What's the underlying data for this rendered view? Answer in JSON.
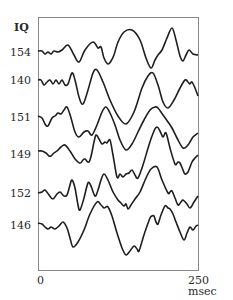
{
  "chart_data": {
    "type": "line",
    "title": "",
    "ylabel": "IQ",
    "xlabel": "",
    "x_tick_labels": [
      "0",
      "250 msec"
    ],
    "x_range_msec": [
      0,
      250
    ],
    "grid": false,
    "legend": null,
    "series": [
      {
        "name": "154",
        "points": [
          [
            38,
            51
          ],
          [
            42,
            51
          ],
          [
            45,
            54
          ],
          [
            48,
            52
          ],
          [
            51,
            54
          ],
          [
            54,
            51
          ],
          [
            58,
            52
          ],
          [
            62,
            50
          ],
          [
            68,
            45
          ],
          [
            74,
            55
          ],
          [
            79,
            62
          ],
          [
            85,
            50
          ],
          [
            93,
            42
          ],
          [
            98,
            48
          ],
          [
            101,
            47
          ],
          [
            104,
            58
          ],
          [
            108,
            64
          ],
          [
            111,
            61
          ],
          [
            114,
            55
          ],
          [
            118,
            42
          ],
          [
            124,
            32
          ],
          [
            132,
            30
          ],
          [
            140,
            40
          ],
          [
            146,
            58
          ],
          [
            151,
            68
          ],
          [
            155,
            60
          ],
          [
            158,
            55
          ],
          [
            162,
            50
          ],
          [
            167,
            38
          ],
          [
            172,
            28
          ],
          [
            176,
            40
          ],
          [
            180,
            56
          ],
          [
            183,
            61
          ],
          [
            186,
            55
          ],
          [
            189,
            50
          ],
          [
            193,
            54
          ],
          [
            198,
            55
          ]
        ]
      },
      {
        "name": "140",
        "points": [
          [
            38,
            80
          ],
          [
            41,
            80
          ],
          [
            44,
            85
          ],
          [
            47,
            82
          ],
          [
            50,
            80
          ],
          [
            53,
            84
          ],
          [
            56,
            80
          ],
          [
            59,
            84
          ],
          [
            62,
            80
          ],
          [
            65,
            85
          ],
          [
            68,
            84
          ],
          [
            72,
            73
          ],
          [
            75,
            80
          ],
          [
            79,
            97
          ],
          [
            83,
            104
          ],
          [
            88,
            90
          ],
          [
            93,
            73
          ],
          [
            97,
            70
          ],
          [
            103,
            82
          ],
          [
            110,
            100
          ],
          [
            118,
            116
          ],
          [
            126,
            124
          ],
          [
            134,
            112
          ],
          [
            142,
            88
          ],
          [
            148,
            76
          ],
          [
            153,
            73
          ],
          [
            158,
            85
          ],
          [
            163,
            102
          ],
          [
            168,
            108
          ],
          [
            174,
            100
          ],
          [
            180,
            88
          ],
          [
            185,
            80
          ],
          [
            188,
            82
          ],
          [
            190,
            84
          ],
          [
            192,
            82
          ],
          [
            195,
            88
          ],
          [
            198,
            96
          ]
        ]
      },
      {
        "name": "151",
        "points": [
          [
            38,
            116
          ],
          [
            42,
            118
          ],
          [
            45,
            124
          ],
          [
            48,
            126
          ],
          [
            52,
            118
          ],
          [
            55,
            116
          ],
          [
            58,
            113
          ],
          [
            61,
            114
          ],
          [
            64,
            110
          ],
          [
            67,
            107
          ],
          [
            71,
            118
          ],
          [
            75,
            132
          ],
          [
            79,
            137
          ],
          [
            84,
            132
          ],
          [
            88,
            131
          ],
          [
            92,
            135
          ],
          [
            97,
            125
          ],
          [
            102,
            112
          ],
          [
            106,
            107
          ],
          [
            110,
            113
          ],
          [
            115,
            125
          ],
          [
            120,
            140
          ],
          [
            126,
            150
          ],
          [
            132,
            144
          ],
          [
            138,
            132
          ],
          [
            144,
            120
          ],
          [
            150,
            110
          ],
          [
            155,
            107
          ],
          [
            158,
            108
          ],
          [
            163,
            115
          ],
          [
            168,
            122
          ],
          [
            172,
            128
          ],
          [
            177,
            138
          ],
          [
            183,
            148
          ],
          [
            188,
            145
          ],
          [
            193,
            137
          ],
          [
            198,
            133
          ]
        ]
      },
      {
        "name": "149",
        "points": [
          [
            38,
            151
          ],
          [
            42,
            151
          ],
          [
            46,
            153
          ],
          [
            49,
            156
          ],
          [
            51,
            156
          ],
          [
            54,
            153
          ],
          [
            57,
            151
          ],
          [
            61,
            147
          ],
          [
            65,
            145
          ],
          [
            70,
            151
          ],
          [
            75,
            159
          ],
          [
            80,
            163
          ],
          [
            83,
            160
          ],
          [
            85,
            159
          ],
          [
            89,
            162
          ],
          [
            92,
            152
          ],
          [
            94,
            142
          ],
          [
            96,
            135
          ],
          [
            99,
            139
          ],
          [
            102,
            144
          ],
          [
            105,
            142
          ],
          [
            107,
            143
          ],
          [
            110,
            140
          ],
          [
            113,
            155
          ],
          [
            117,
            177
          ],
          [
            120,
            174
          ],
          [
            123,
            177
          ],
          [
            126,
            174
          ],
          [
            129,
            173
          ],
          [
            132,
            170
          ],
          [
            135,
            175
          ],
          [
            138,
            178
          ],
          [
            143,
            165
          ],
          [
            149,
            145
          ],
          [
            154,
            131
          ],
          [
            157,
            127
          ],
          [
            160,
            131
          ],
          [
            163,
            137
          ],
          [
            166,
            133
          ],
          [
            170,
            148
          ],
          [
            175,
            164
          ],
          [
            178,
            162
          ],
          [
            180,
            163
          ],
          [
            183,
            170
          ],
          [
            185,
            174
          ],
          [
            188,
            172
          ],
          [
            192,
            162
          ],
          [
            195,
            158
          ],
          [
            198,
            155
          ]
        ]
      },
      {
        "name": "152",
        "points": [
          [
            38,
            193
          ],
          [
            42,
            192
          ],
          [
            45,
            190
          ],
          [
            49,
            195
          ],
          [
            53,
            199
          ],
          [
            57,
            194
          ],
          [
            60,
            192
          ],
          [
            62,
            194
          ],
          [
            64,
            196
          ],
          [
            67,
            195
          ],
          [
            70,
            185
          ],
          [
            72,
            180
          ],
          [
            75,
            188
          ],
          [
            78,
            205
          ],
          [
            80,
            210
          ],
          [
            84,
            198
          ],
          [
            88,
            183
          ],
          [
            91,
            186
          ],
          [
            95,
            196
          ],
          [
            98,
            190
          ],
          [
            101,
            180
          ],
          [
            104,
            174
          ],
          [
            108,
            180
          ],
          [
            113,
            192
          ],
          [
            118,
            200
          ],
          [
            121,
            203
          ],
          [
            124,
            206
          ],
          [
            126,
            204
          ],
          [
            128,
            209
          ],
          [
            131,
            205
          ],
          [
            135,
            199
          ],
          [
            140,
            192
          ],
          [
            146,
            178
          ],
          [
            151,
            169
          ],
          [
            157,
            167
          ],
          [
            162,
            180
          ],
          [
            168,
            193
          ],
          [
            170,
            192
          ],
          [
            172,
            191
          ],
          [
            175,
            198
          ],
          [
            178,
            205
          ],
          [
            181,
            202
          ],
          [
            183,
            200
          ],
          [
            187,
            204
          ],
          [
            190,
            208
          ],
          [
            194,
            202
          ],
          [
            198,
            196
          ]
        ]
      },
      {
        "name": "146",
        "points": [
          [
            38,
            223
          ],
          [
            42,
            224
          ],
          [
            45,
            227
          ],
          [
            48,
            229
          ],
          [
            51,
            227
          ],
          [
            53,
            228
          ],
          [
            55,
            229
          ],
          [
            59,
            226
          ],
          [
            63,
            222
          ],
          [
            67,
            228
          ],
          [
            70,
            238
          ],
          [
            73,
            247
          ],
          [
            78,
            242
          ],
          [
            84,
            230
          ],
          [
            90,
            214
          ],
          [
            97,
            202
          ],
          [
            101,
            205
          ],
          [
            104,
            208
          ],
          [
            106,
            207
          ],
          [
            108,
            207
          ],
          [
            112,
            216
          ],
          [
            117,
            233
          ],
          [
            122,
            248
          ],
          [
            126,
            255
          ],
          [
            130,
            251
          ],
          [
            134,
            246
          ],
          [
            137,
            249
          ],
          [
            139,
            251
          ],
          [
            143,
            238
          ],
          [
            147,
            226
          ],
          [
            150,
            218
          ],
          [
            152,
            216
          ],
          [
            154,
            216
          ],
          [
            156,
            222
          ],
          [
            158,
            224
          ],
          [
            161,
            215
          ],
          [
            165,
            206
          ],
          [
            168,
            208
          ],
          [
            170,
            209
          ],
          [
            173,
            214
          ],
          [
            176,
            222
          ],
          [
            180,
            232
          ],
          [
            184,
            240
          ],
          [
            187,
            233
          ],
          [
            190,
            227
          ],
          [
            193,
            230
          ],
          [
            196,
            226
          ],
          [
            198,
            225
          ]
        ]
      }
    ],
    "row_labels": [
      "154",
      "140",
      "151",
      "149",
      "152",
      "146"
    ]
  },
  "labels": {
    "y_title": "IQ",
    "rows": [
      {
        "text": "154",
        "y": 47
      },
      {
        "text": "140",
        "y": 75
      },
      {
        "text": "151",
        "y": 112
      },
      {
        "text": "149",
        "y": 149
      },
      {
        "text": "152",
        "y": 188
      },
      {
        "text": "146",
        "y": 220
      }
    ],
    "x_start": "0",
    "x_end": "250 msec"
  },
  "colors": {
    "trace": "#1e1e1e",
    "frame": "#8a8a8a",
    "text": "#2a2a2a"
  }
}
